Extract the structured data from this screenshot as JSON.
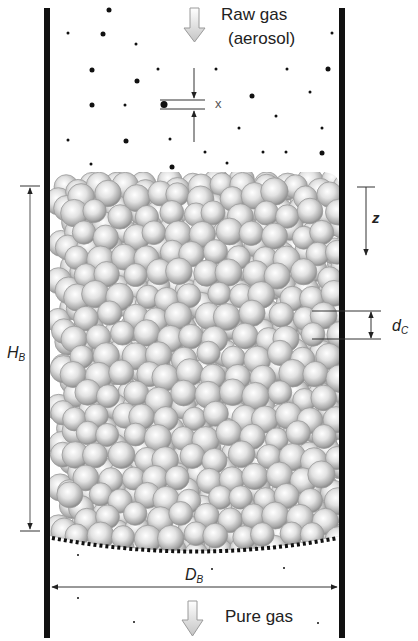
{
  "diagram": {
    "labels": {
      "inlet": "Raw gas",
      "inlet_sub": "(aerosol)",
      "outlet": "Pure gas",
      "particle_size": "x",
      "depth": "z",
      "collector_diameter_main": "d",
      "collector_diameter_sub": "C",
      "bed_height_main": "H",
      "bed_height_sub": "B",
      "bed_diameter_main": "D",
      "bed_diameter_sub": "B"
    },
    "colors": {
      "wall": "#111111",
      "sphere_light": "#ffffff",
      "sphere_mid": "#c8c8c8",
      "sphere_dark": "#8a8a8a",
      "arrow_fill": "#d4d4d4",
      "arrow_stroke": "#9a9a9a",
      "dimension_line": "#333333",
      "aerosol_dot": "#111111"
    },
    "geometry": {
      "wall_left_x": 47,
      "wall_right_x": 342,
      "wall_top_y": 8,
      "wall_bottom_y": 638,
      "bed_top_y": 172,
      "bed_bottom_y": 548,
      "sphere_radius": 13,
      "sphere_seed": 7
    },
    "aerosol_particles": [
      [
        109,
        10,
        2.5
      ],
      [
        68,
        33,
        1.5
      ],
      [
        103,
        34,
        2.5
      ],
      [
        136,
        44,
        1.5
      ],
      [
        332,
        33,
        1.5
      ],
      [
        92,
        70,
        2.5
      ],
      [
        158,
        69,
        1.5
      ],
      [
        216,
        69,
        1.5
      ],
      [
        287,
        69,
        1.5
      ],
      [
        328,
        69,
        2.5
      ],
      [
        137,
        81,
        2.5
      ],
      [
        310,
        92,
        1.5
      ],
      [
        252,
        96,
        2.5
      ],
      [
        92,
        105,
        2.5
      ],
      [
        125,
        105,
        1.5
      ],
      [
        276,
        116,
        1.5
      ],
      [
        239,
        128,
        1.5
      ],
      [
        322,
        128,
        1.5
      ],
      [
        68,
        140,
        1.5
      ],
      [
        126,
        141,
        2.5
      ],
      [
        170,
        139,
        1.5
      ],
      [
        205,
        152,
        1.5
      ],
      [
        263,
        152,
        1.5
      ],
      [
        286,
        152,
        1.5
      ],
      [
        322,
        153,
        2.5
      ],
      [
        91,
        164,
        1.5
      ],
      [
        172,
        167,
        2.5
      ],
      [
        227,
        163,
        1.5
      ]
    ],
    "outlet_particles": [
      [
        78,
        555,
        1
      ],
      [
        212,
        569,
        1
      ],
      [
        284,
        568,
        1
      ],
      [
        78,
        598,
        1
      ],
      [
        134,
        622,
        1
      ],
      [
        318,
        623,
        1
      ]
    ]
  }
}
